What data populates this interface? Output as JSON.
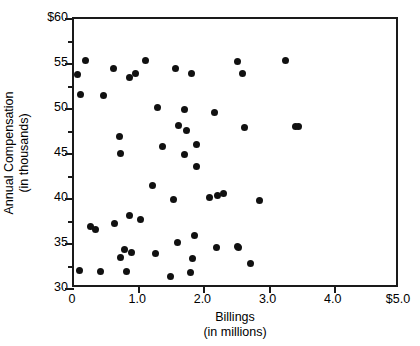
{
  "chart_data": {
    "type": "scatter",
    "title": "",
    "xlabel": "Billings",
    "xlabel_sub": "(in millions)",
    "ylabel": "Annual Compensation",
    "ylabel_sub": "(in thousands)",
    "xlim": [
      0,
      5.0
    ],
    "ylim": [
      30,
      60
    ],
    "grid": false,
    "legend": null,
    "marker_color": "#111111",
    "axis_color": "#1a1a1a",
    "xticks": [
      0,
      1.0,
      2.0,
      3.0,
      4.0,
      5.0
    ],
    "xtick_labels": [
      "0",
      "1.0",
      "2.0",
      "3.0",
      "4.0",
      "$5.0"
    ],
    "yticks": [
      30,
      35,
      40,
      45,
      50,
      55,
      60
    ],
    "ytick_labels": [
      "30",
      "35",
      "40",
      "45",
      "50",
      "55",
      "$60"
    ],
    "y_minor_ticks": [
      32.5,
      37.5,
      42.5,
      47.5,
      52.5,
      57.5
    ],
    "points": [
      {
        "x": 0.05,
        "y": 53.8
      },
      {
        "x": 0.18,
        "y": 55.4
      },
      {
        "x": 0.1,
        "y": 51.6
      },
      {
        "x": 0.08,
        "y": 32.1
      },
      {
        "x": 0.25,
        "y": 36.9
      },
      {
        "x": 0.33,
        "y": 36.6
      },
      {
        "x": 0.4,
        "y": 31.9
      },
      {
        "x": 0.6,
        "y": 54.5
      },
      {
        "x": 0.62,
        "y": 37.3
      },
      {
        "x": 0.7,
        "y": 46.9
      },
      {
        "x": 0.72,
        "y": 45.1
      },
      {
        "x": 0.78,
        "y": 34.4
      },
      {
        "x": 0.72,
        "y": 33.5
      },
      {
        "x": 0.46,
        "y": 51.5
      },
      {
        "x": 0.85,
        "y": 53.5
      },
      {
        "x": 0.95,
        "y": 54.0
      },
      {
        "x": 0.85,
        "y": 38.2
      },
      {
        "x": 0.88,
        "y": 34.1
      },
      {
        "x": 0.8,
        "y": 32.0
      },
      {
        "x": 1.1,
        "y": 55.4
      },
      {
        "x": 1.02,
        "y": 37.7
      },
      {
        "x": 1.28,
        "y": 50.2
      },
      {
        "x": 1.2,
        "y": 41.5
      },
      {
        "x": 1.25,
        "y": 33.9
      },
      {
        "x": 1.35,
        "y": 45.8
      },
      {
        "x": 1.48,
        "y": 31.4
      },
      {
        "x": 1.55,
        "y": 54.5
      },
      {
        "x": 1.6,
        "y": 48.2
      },
      {
        "x": 1.52,
        "y": 40.0
      },
      {
        "x": 1.72,
        "y": 47.6
      },
      {
        "x": 1.7,
        "y": 50.0
      },
      {
        "x": 1.7,
        "y": 44.9
      },
      {
        "x": 1.58,
        "y": 35.2
      },
      {
        "x": 1.8,
        "y": 54.0
      },
      {
        "x": 1.88,
        "y": 46.1
      },
      {
        "x": 1.88,
        "y": 43.6
      },
      {
        "x": 1.85,
        "y": 35.9
      },
      {
        "x": 1.82,
        "y": 33.4
      },
      {
        "x": 1.78,
        "y": 31.8
      },
      {
        "x": 2.15,
        "y": 49.6
      },
      {
        "x": 2.08,
        "y": 40.2
      },
      {
        "x": 2.2,
        "y": 40.4
      },
      {
        "x": 2.3,
        "y": 40.6
      },
      {
        "x": 2.18,
        "y": 34.6
      },
      {
        "x": 2.5,
        "y": 55.3
      },
      {
        "x": 2.58,
        "y": 53.9
      },
      {
        "x": 2.62,
        "y": 48.0
      },
      {
        "x": 2.52,
        "y": 34.6
      },
      {
        "x": 2.5,
        "y": 34.7
      },
      {
        "x": 2.85,
        "y": 39.8
      },
      {
        "x": 2.7,
        "y": 32.8
      },
      {
        "x": 3.25,
        "y": 55.4
      },
      {
        "x": 3.4,
        "y": 48.1
      },
      {
        "x": 3.45,
        "y": 48.1
      }
    ]
  }
}
